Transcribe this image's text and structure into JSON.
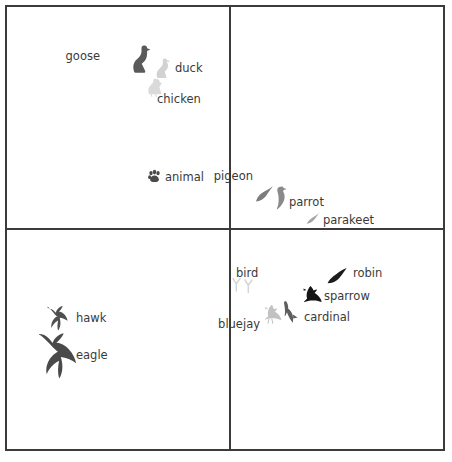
{
  "figure": {
    "type": "scatter-concept-map",
    "background": "#ffffff",
    "border_color": "#3b3b3b",
    "panels": 4,
    "grid": "2x2"
  },
  "colors": {
    "text": "#3a3a3a",
    "very_light_gray": "#d8d8d8",
    "light_gray": "#bdbdbd",
    "mid_gray": "#8f8f8f",
    "dark_gray": "#5a5a5a",
    "near_black": "#1f1f1f",
    "black": "#111111"
  },
  "panels": [
    {
      "id": "panel-top-left",
      "name": "top-left-panel",
      "markers": [
        {
          "label": "goose",
          "icon": "goose-icon",
          "color": "#5a5a5a",
          "icon_x": 131,
          "icon_y": 45,
          "icon_w": 20,
          "icon_h": 28,
          "label_x": 100,
          "label_y": 51,
          "label_align": "right"
        },
        {
          "label": "duck",
          "icon": "duck-icon",
          "color": "#d2d2d2",
          "icon_x": 155,
          "icon_y": 58,
          "icon_w": 16,
          "icon_h": 20,
          "label_x": 175,
          "label_y": 63,
          "label_align": "left"
        },
        {
          "label": "chicken",
          "icon": "chicken-icon",
          "color": "#dadada",
          "icon_x": 147,
          "icon_y": 78,
          "icon_w": 16,
          "icon_h": 19,
          "label_x": 157,
          "label_y": 94,
          "label_align": "left"
        },
        {
          "label": "animal",
          "icon": "paw-icon",
          "color": "#4a4a4a",
          "icon_x": 148,
          "icon_y": 170,
          "icon_w": 13,
          "icon_h": 13,
          "label_x": 165,
          "label_y": 172,
          "label_align": "left"
        }
      ]
    },
    {
      "id": "panel-top-right",
      "name": "top-right-panel",
      "markers": [
        {
          "label": "pigeon",
          "icon": "pigeon-icon",
          "color": "#7d7d7d",
          "icon_x": 256,
          "icon_y": 185,
          "icon_w": 17,
          "icon_h": 17,
          "label_x": 253,
          "label_y": 171,
          "label_align": "right"
        },
        {
          "label": "parrot",
          "icon": "parrot-icon",
          "color": "#8a8a8a",
          "icon_x": 275,
          "icon_y": 186,
          "icon_w": 12,
          "icon_h": 24,
          "label_x": 289,
          "label_y": 197,
          "label_align": "left"
        },
        {
          "label": "parakeet",
          "icon": "parakeet-icon",
          "color": "#a5a5a5",
          "icon_x": 305,
          "icon_y": 212,
          "icon_w": 15,
          "icon_h": 12,
          "label_x": 323,
          "label_y": 215,
          "label_align": "left"
        }
      ]
    },
    {
      "id": "panel-bottom-left",
      "name": "bottom-left-panel",
      "markers": [
        {
          "label": "hawk",
          "icon": "hawk-icon",
          "color": "#4f4f4f",
          "icon_x": 47,
          "icon_y": 305,
          "icon_w": 26,
          "icon_h": 26,
          "label_x": 76,
          "label_y": 313,
          "label_align": "left"
        },
        {
          "label": "eagle",
          "icon": "eagle-icon",
          "color": "#4a4a4a",
          "icon_x": 37,
          "icon_y": 332,
          "icon_w": 42,
          "icon_h": 46,
          "label_x": 76,
          "label_y": 350,
          "label_align": "left"
        }
      ]
    },
    {
      "id": "panel-bottom-right",
      "name": "bottom-right-panel",
      "markers": [
        {
          "label": "bird",
          "icon": "bird-tracks-icon",
          "color": "#d5d5d5",
          "icon_x": 232,
          "icon_y": 278,
          "icon_w": 22,
          "icon_h": 17,
          "label_x": 236,
          "label_y": 268,
          "label_align": "left"
        },
        {
          "label": "robin",
          "icon": "robin-icon",
          "color": "#1d1d1d",
          "icon_x": 327,
          "icon_y": 267,
          "icon_w": 20,
          "icon_h": 17,
          "label_x": 353,
          "label_y": 268,
          "label_align": "left"
        },
        {
          "label": "sparrow",
          "icon": "sparrow-icon",
          "color": "#151515",
          "icon_x": 303,
          "icon_y": 285,
          "icon_w": 20,
          "icon_h": 18,
          "label_x": 324,
          "label_y": 291,
          "label_align": "left"
        },
        {
          "label": "cardinal",
          "icon": "cardinal-icon",
          "color": "#5e5e5e",
          "icon_x": 284,
          "icon_y": 301,
          "icon_w": 14,
          "icon_h": 22,
          "label_x": 304,
          "label_y": 312,
          "label_align": "left"
        },
        {
          "label": "bluejay",
          "icon": "bluejay-icon",
          "color": "#c2c2c2",
          "icon_x": 263,
          "icon_y": 304,
          "icon_w": 20,
          "icon_h": 20,
          "label_x": 260,
          "label_y": 319,
          "label_align": "right"
        }
      ]
    }
  ]
}
